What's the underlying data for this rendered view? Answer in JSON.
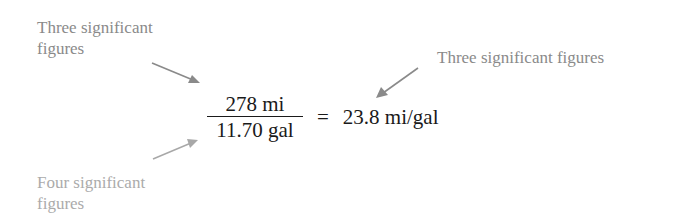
{
  "annotations": {
    "top_left": {
      "lines": [
        "Three significant",
        "figures"
      ],
      "color": "#8a8a8a",
      "points_to": "numerator"
    },
    "right": {
      "lines": [
        "Three significant figures"
      ],
      "color": "#8a8a8a",
      "points_to": "result"
    },
    "bottom_left": {
      "lines": [
        "Four significant",
        "figures"
      ],
      "color": "#ababab",
      "points_to": "denominator"
    }
  },
  "equation": {
    "numerator": "278 mi",
    "denominator": "11.70 gal",
    "operator": "=",
    "result": "23.8 mi/gal"
  },
  "colors": {
    "equation_text": "#1a1a1a",
    "arrow": "#8a8a8a",
    "arrow_light": "#a8a8a8",
    "background": "#ffffff"
  }
}
